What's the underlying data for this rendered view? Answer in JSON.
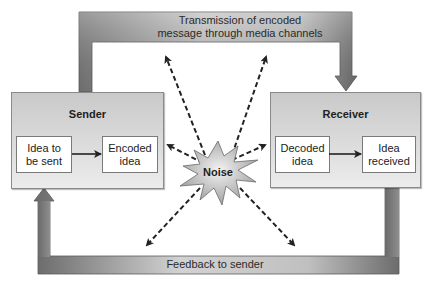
{
  "diagram": {
    "sender": {
      "title": "Sender",
      "steps": [
        "Idea to\nbe sent",
        "Encoded\nidea"
      ]
    },
    "receiver": {
      "title": "Receiver",
      "steps": [
        "Decoded\nidea",
        "Idea\nreceived"
      ]
    },
    "noise": {
      "label": "Noise",
      "arrow_count": 6,
      "icon": "starburst-icon"
    },
    "channels": {
      "transmission": {
        "label_line1": "Transmission of encoded",
        "label_line2": "message through media channels",
        "direction": "sender-to-receiver"
      },
      "feedback": {
        "label": "Feedback to sender",
        "direction": "receiver-to-sender"
      }
    },
    "colors": {
      "bar_dark": "#6e6e6e",
      "bar_light": "#d8d8d8",
      "box_fill": "#d6d6d6",
      "inner_box_fill": "#ffffff",
      "noise_fill": "#c8c8c8",
      "dashed_arrow": "#222222"
    }
  }
}
